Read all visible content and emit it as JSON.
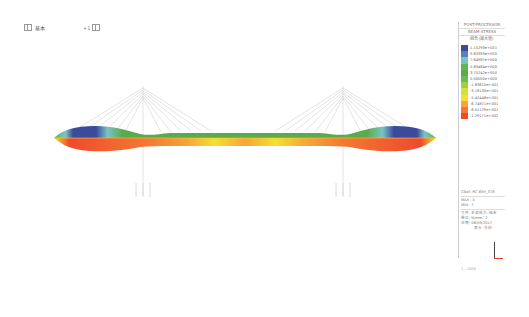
{
  "toolbar": {
    "view_label": "基本",
    "zoom_label": "+1"
  },
  "panel": {
    "title": "POST-PROCESSOR",
    "subtitle": "BEAM STRESS",
    "component": "組合(最大值)",
    "legend": [
      {
        "color": "#3b4a9a",
        "value": "1.15293e+001"
      },
      {
        "color": "#5a7fc0",
        "value": "9.63393e+000"
      },
      {
        "color": "#7ac3c4",
        "value": "7.64987e+000"
      },
      {
        "color": "#5fb856",
        "value": "5.69464e+000"
      },
      {
        "color": "#5aab4c",
        "value": "3.75242e+000"
      },
      {
        "color": "#6cbb4a",
        "value": "0.00000e+000"
      },
      {
        "color": "#9ed044",
        "value": "-1.83610e+001"
      },
      {
        "color": "#d6e03a",
        "value": "-3.18130e+001"
      },
      {
        "color": "#f3e032",
        "value": "-5.42448e+001"
      },
      {
        "color": "#f7a53a",
        "value": "-6.74871e+001"
      },
      {
        "color": "#f47a34",
        "value": "-8.01129e+001"
      },
      {
        "color": "#ee4a2e",
        "value": "-1.29171e+002"
      }
    ],
    "info": {
      "model": "CBall: RC BSH_ST8",
      "max": "MAX : 5",
      "min": "MIN : 7",
      "file": "文件: 主梁应力-组合",
      "unit": "单位: N/mm^2",
      "date": "日期: 06/09/2017",
      "view_dir": "表示-方向"
    },
    "scale": "1 : 1000"
  },
  "bridge": {
    "type": "cable-stayed",
    "towers": 2,
    "deck_top_colors": [
      "#3b4a9a",
      "#7ac3c4",
      "#5aab4c"
    ],
    "deck_bottom_colors": [
      "#ee4a2e",
      "#f47a34",
      "#f3e032"
    ]
  }
}
